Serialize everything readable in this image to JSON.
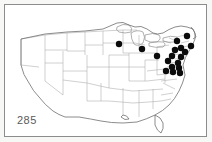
{
  "figure": {
    "number": "285",
    "caption_visible": false,
    "frame_color": "#8c8c8c",
    "background_color": "#ffffff"
  },
  "map": {
    "name": "united-states-distribution-map",
    "region": "Contiguous United States",
    "outline_color": "#6f6f6f",
    "state_border_color": "#a8a8a8",
    "dot_color": "#0b0b0b",
    "dot_radius": 3.2,
    "dot_count": 18
  },
  "chart_data": {
    "type": "scatter",
    "title": "285",
    "xlabel": "",
    "ylabel": "",
    "xlim": [
      0,
      201
    ],
    "ylim": [
      0,
      131
    ],
    "grid": false,
    "legend": null,
    "series": [
      {
        "name": "occurrence-records",
        "marker": "filled-circle",
        "color": "#0b0b0b",
        "points": [
          {
            "id": "dot-01",
            "x": 114.0,
            "y": 39.0,
            "region": "Wisconsin"
          },
          {
            "id": "dot-02",
            "x": 137.0,
            "y": 44.0,
            "region": "Michigan / N Indiana"
          },
          {
            "id": "dot-03",
            "x": 152.0,
            "y": 51.0,
            "region": "Ohio"
          },
          {
            "id": "dot-04",
            "x": 182.0,
            "y": 31.0,
            "region": "New Hampshire / Maine"
          },
          {
            "id": "dot-05",
            "x": 172.0,
            "y": 36.0,
            "region": "Vermont / New York N"
          },
          {
            "id": "dot-06",
            "x": 186.0,
            "y": 41.0,
            "region": "Massachusetts"
          },
          {
            "id": "dot-07",
            "x": 176.0,
            "y": 43.0,
            "region": "E New York"
          },
          {
            "id": "dot-08",
            "x": 170.0,
            "y": 45.0,
            "region": "C New York"
          },
          {
            "id": "dot-09",
            "x": 180.0,
            "y": 47.0,
            "region": "Connecticut"
          },
          {
            "id": "dot-10",
            "x": 167.0,
            "y": 51.0,
            "region": "N Pennsylvania"
          },
          {
            "id": "dot-11",
            "x": 176.0,
            "y": 52.0,
            "region": "New Jersey N"
          },
          {
            "id": "dot-12",
            "x": 163.0,
            "y": 56.0,
            "region": "C Pennsylvania"
          },
          {
            "id": "dot-13",
            "x": 173.0,
            "y": 58.0,
            "region": "E Pennsylvania"
          },
          {
            "id": "dot-14",
            "x": 167.0,
            "y": 62.0,
            "region": "Maryland N"
          },
          {
            "id": "dot-15",
            "x": 174.0,
            "y": 63.0,
            "region": "Delaware"
          },
          {
            "id": "dot-16",
            "x": 161.0,
            "y": 66.0,
            "region": "Maryland W"
          },
          {
            "id": "dot-17",
            "x": 168.0,
            "y": 67.0,
            "region": "Maryland / Virginia"
          },
          {
            "id": "dot-18",
            "x": 175.0,
            "y": 68.0,
            "region": "Delmarva"
          }
        ]
      }
    ]
  }
}
